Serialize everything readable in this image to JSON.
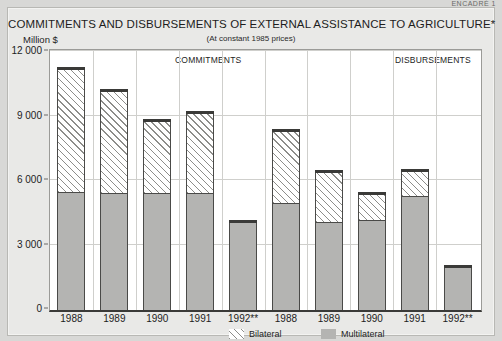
{
  "page": {
    "cut_header": "ENCADRÉ 1"
  },
  "chart_data": {
    "type": "bar",
    "title": "COMMITMENTS AND DISBURSEMENTS OF EXTERNAL ASSISTANCE TO AGRICULTURE*",
    "subtitle": "(At constant 1985 prices)",
    "ylabel": "Million $",
    "xlabel": "",
    "ylim": [
      0,
      12000
    ],
    "yticks": [
      0,
      3000,
      6000,
      9000,
      12000
    ],
    "ytick_labels": [
      "0",
      "3 000",
      "6 000",
      "9 000",
      "12 000"
    ],
    "grid": true,
    "stacked": true,
    "legend_position": "bottom",
    "legend": [
      "Bilateral",
      "Multilateral"
    ],
    "series": [
      {
        "name": "Multilateral",
        "color": "#b4b4b2",
        "values": [
          5500,
          5450,
          5450,
          5450,
          4200,
          5000,
          4100,
          4200,
          5300,
          2100
        ]
      },
      {
        "name": "Bilateral",
        "color": "#ffffff",
        "values": [
          5800,
          4850,
          3450,
          3800,
          0,
          3400,
          2400,
          1300,
          1250,
          0
        ]
      }
    ],
    "totals": [
      11300,
      10300,
      8900,
      9250,
      4200,
      8400,
      6500,
      5500,
      6550,
      2100
    ],
    "groups": [
      {
        "label": "COMMITMENTS",
        "categories": [
          "1988",
          "1989",
          "1990",
          "1991",
          "1992**"
        ]
      },
      {
        "label": "DISBURSEMENTS",
        "categories": [
          "1988",
          "1989",
          "1990",
          "1991",
          "1992**"
        ]
      }
    ],
    "categories": [
      "1988",
      "1989",
      "1990",
      "1991",
      "1992**",
      "1988",
      "1989",
      "1990",
      "1991",
      "1992**"
    ]
  }
}
